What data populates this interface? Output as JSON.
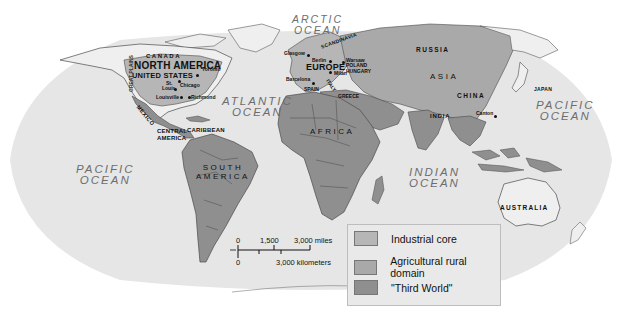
{
  "map": {
    "title": "World: Industrial core, agricultural rural domain and Third World",
    "colors": {
      "ocean": "#e6e6e6",
      "background": "#ffffff",
      "industrial_core": "#b6b6b6",
      "agricultural_rural_domain": "#a9a9a9",
      "third_world": "#8f8f8f",
      "unclassified_land": "#efefef",
      "border": "#4a4a4a"
    },
    "oceans": [
      {
        "name": "ARCTIC OCEAN",
        "line1": "ARCTIC",
        "line2": "OCEAN"
      },
      {
        "name": "ATLANTIC OCEAN",
        "line1": "ATLANTIC",
        "line2": "OCEAN"
      },
      {
        "name": "PACIFIC OCEAN (west)",
        "line1": "PACIFIC",
        "line2": "OCEAN"
      },
      {
        "name": "PACIFIC OCEAN (east)",
        "line1": "PACIFIC",
        "line2": "OCEAN"
      },
      {
        "name": "INDIAN OCEAN",
        "line1": "INDIAN",
        "line2": "OCEAN"
      }
    ],
    "continents": {
      "north_america": "NORTH AMERICA",
      "south_america_1": "SOUTH",
      "south_america_2": "AMERICA",
      "europe": "EUROPE",
      "africa": "AFRICA",
      "asia": "ASIA",
      "central_america_1": "CENTRAL",
      "central_america_2": "AMERICA"
    },
    "regions": {
      "canada": "CANADA",
      "united_states": "UNITED STATES",
      "great_plains": "GREAT PLAINS",
      "mexico": "MEXICO",
      "caribbean": "CARIBBEAN",
      "scandinavia": "SCANDINAVIA",
      "poland_hungary_1": "POLAND",
      "poland_hungary_2": "HUNGARY",
      "spain": "SPAIN",
      "italy": "ITALY",
      "greece": "GREECE",
      "russia": "RUSSIA",
      "china": "CHINA",
      "india": "INDIA",
      "japan": "JAPAN",
      "australia": "AUSTRALIA"
    },
    "cities": {
      "toronto": "Toronto",
      "st_louis_1": "St.",
      "st_louis_2": "Louis",
      "chicago": "Chicago",
      "louisville": "Louisville",
      "richmond": "Richmond",
      "glasgow": "Glasgow",
      "berlin": "Berlin",
      "warsaw": "Warsaw",
      "barcelona": "Barcelona",
      "milan": "Milan",
      "canton": "Canton"
    }
  },
  "scale_bar": {
    "miles_ticks": [
      "0",
      "1,500",
      "3,000 miles"
    ],
    "km_ticks": [
      "0",
      "3,000 kilometers"
    ]
  },
  "legend": {
    "items": [
      {
        "label": "Industrial core",
        "color": "#b6b6b6"
      },
      {
        "label": "Agricultural rural domain",
        "color": "#a9a9a9"
      },
      {
        "label": "\"Third World\"",
        "color": "#8f8f8f"
      }
    ]
  }
}
